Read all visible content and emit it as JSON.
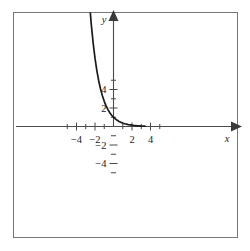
{
  "figure": {
    "background_color": "#ffffff",
    "frame_color": "#6e6e6e",
    "axis_color": "#4a4a4a",
    "curve_color": "#1a1a1a",
    "label_color": "#1c1c1c"
  },
  "axes": {
    "x_axis_label": "x",
    "y_axis_label": "y",
    "x_tick_labels": [
      "−4",
      "−2",
      "2",
      "4"
    ],
    "x_tick_values": [
      -4,
      -2,
      2,
      4
    ],
    "y_tick_labels": [
      "4",
      "2",
      "−2",
      "−4"
    ],
    "y_tick_values": [
      4,
      2,
      -2,
      -4
    ],
    "x_minor_ticks": [
      -5,
      -4,
      -3,
      -2,
      -1,
      1,
      2,
      3,
      4,
      5
    ],
    "y_minor_ticks": [
      -5,
      -4,
      -3,
      -2,
      -1,
      1,
      2,
      3,
      4,
      5
    ],
    "x_arrow": "arrow-right",
    "y_arrow": "arrow-up"
  },
  "chart_data": {
    "type": "line",
    "title": "",
    "xlabel": "x",
    "ylabel": "y",
    "xlim": [
      -5.6,
      5.6
    ],
    "ylim": [
      -5.6,
      5.6
    ],
    "grid": false,
    "legend": null,
    "series": [
      {
        "name": "exponential decay",
        "function": "y = e^(-x)",
        "x": [
          -2.8,
          -2.6,
          -2.4,
          -2.2,
          -2.0,
          -1.8,
          -1.6,
          -1.4,
          -1.2,
          -1.0,
          -0.8,
          -0.6,
          -0.4,
          -0.2,
          0.0,
          0.2,
          0.4,
          0.6,
          0.8,
          1.0,
          1.2,
          1.4,
          1.6,
          1.8,
          2.0,
          2.2,
          2.4,
          2.6,
          2.8,
          3.0,
          3.2,
          3.4
        ],
        "y": [
          16.44,
          13.46,
          11.02,
          9.03,
          7.39,
          6.05,
          4.95,
          4.06,
          3.32,
          2.72,
          2.23,
          1.82,
          1.49,
          1.22,
          1.0,
          0.82,
          0.67,
          0.55,
          0.45,
          0.37,
          0.3,
          0.25,
          0.2,
          0.17,
          0.14,
          0.11,
          0.09,
          0.07,
          0.06,
          0.05,
          0.04,
          0.03
        ]
      }
    ],
    "annotations": {
      "y_intercept": 1,
      "horizontal_asymptote": 0,
      "curve_x_start": -2.8,
      "curve_x_end": 3.4
    }
  }
}
